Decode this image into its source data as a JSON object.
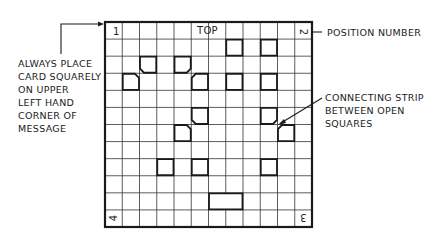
{
  "diagram": {
    "type": "cipher-grille-card",
    "grid": {
      "rows": 12,
      "cols": 12,
      "x": 105,
      "y": 22,
      "width": 207,
      "height": 205
    },
    "top_label": "TOP",
    "corner_numbers": {
      "top_left": "1",
      "top_right": "2",
      "bottom_right": "3",
      "bottom_left": "4"
    },
    "open_squares": [
      {
        "row": 1,
        "col": 7,
        "span": 1,
        "chamfer": ""
      },
      {
        "row": 1,
        "col": 9,
        "span": 1,
        "chamfer": ""
      },
      {
        "row": 2,
        "col": 2,
        "span": 1,
        "chamfer": "bl"
      },
      {
        "row": 2,
        "col": 4,
        "span": 1,
        "chamfer": "br"
      },
      {
        "row": 3,
        "col": 1,
        "span": 1,
        "chamfer": "tr"
      },
      {
        "row": 3,
        "col": 5,
        "span": 1,
        "chamfer": "tl"
      },
      {
        "row": 3,
        "col": 7,
        "span": 1,
        "chamfer": ""
      },
      {
        "row": 3,
        "col": 9,
        "span": 1,
        "chamfer": ""
      },
      {
        "row": 5,
        "col": 5,
        "span": 1,
        "chamfer": "bl"
      },
      {
        "row": 5,
        "col": 9,
        "span": 1,
        "chamfer": "br"
      },
      {
        "row": 6,
        "col": 4,
        "span": 1,
        "chamfer": "tr"
      },
      {
        "row": 6,
        "col": 10,
        "span": 1,
        "chamfer": "tl"
      },
      {
        "row": 8,
        "col": 3,
        "span": 1,
        "chamfer": ""
      },
      {
        "row": 8,
        "col": 5,
        "span": 1,
        "chamfer": ""
      },
      {
        "row": 8,
        "col": 9,
        "span": 1,
        "chamfer": ""
      },
      {
        "row": 10,
        "col": 6,
        "span": 2,
        "chamfer": ""
      }
    ],
    "annotations": {
      "left": [
        "ALWAYS PLACE",
        "CARD SQUARELY",
        "ON UPPER",
        "LEFT HAND",
        "CORNER OF",
        "MESSAGE"
      ],
      "position_number": "POSITION NUMBER",
      "connecting_strip": [
        "CONNECTING STRIP",
        "BETWEEN OPEN",
        "SQUARES"
      ]
    },
    "colors": {
      "line": "#1a1a1a",
      "grid": "#333333",
      "background": "#ffffff"
    }
  }
}
